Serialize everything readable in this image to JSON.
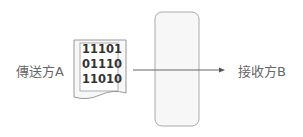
{
  "sender": {
    "label": "傳送方A"
  },
  "receiver": {
    "label": "接收方B"
  },
  "document": {
    "lines": [
      "11101",
      "01110",
      "11010"
    ]
  },
  "channel": {
    "shape": "rounded-rectangle"
  },
  "arrow": {
    "direction": "right"
  }
}
